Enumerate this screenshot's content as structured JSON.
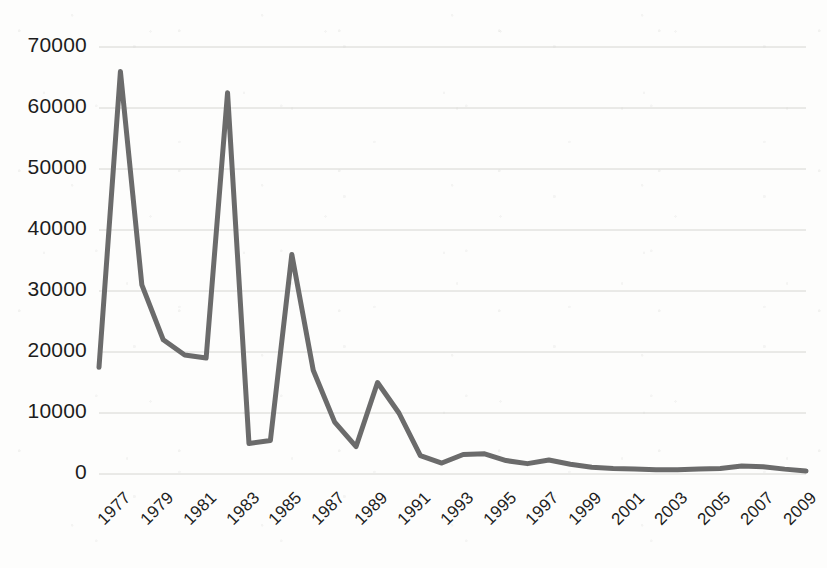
{
  "chart_data": {
    "type": "line",
    "title": "",
    "xlabel": "",
    "ylabel": "",
    "xlim": [
      1977,
      2010
    ],
    "ylim": [
      0,
      70000
    ],
    "grid": true,
    "legend": false,
    "line_color": "#6b6b6b",
    "line_width": 5,
    "background_color": "#fdfdfc",
    "gridline_color": "#d6d6d2",
    "axis_label_color": "#1d1d1d",
    "y_ticks": [
      0,
      10000,
      20000,
      30000,
      40000,
      50000,
      60000,
      70000
    ],
    "y_tick_labels": [
      "0",
      "10000",
      "20000",
      "30000",
      "40000",
      "50000",
      "60000",
      "70000"
    ],
    "x_ticks": [
      1977,
      1979,
      1981,
      1983,
      1985,
      1987,
      1989,
      1991,
      1993,
      1995,
      1997,
      1999,
      2001,
      2003,
      2005,
      2007,
      2009
    ],
    "x_tick_labels": [
      "1977",
      "1979",
      "1981",
      "1983",
      "1985",
      "1987",
      "1989",
      "1991",
      "1993",
      "1995",
      "1997",
      "1999",
      "2001",
      "2003",
      "2005",
      "2007",
      "2009"
    ],
    "x": [
      1977,
      1978,
      1979,
      1980,
      1981,
      1982,
      1983,
      1984,
      1985,
      1986,
      1987,
      1988,
      1989,
      1990,
      1991,
      1992,
      1993,
      1994,
      1995,
      1996,
      1997,
      1998,
      1999,
      2000,
      2001,
      2002,
      2003,
      2004,
      2005,
      2006,
      2007,
      2008,
      2009,
      2010
    ],
    "values": [
      17500,
      66000,
      31000,
      22000,
      19500,
      19000,
      62500,
      5000,
      5500,
      36000,
      17000,
      8500,
      4500,
      15000,
      10000,
      3000,
      1800,
      3200,
      3300,
      2200,
      1700,
      2300,
      1600,
      1100,
      900,
      800,
      700,
      700,
      800,
      900,
      1300,
      1200,
      800,
      500
    ]
  }
}
